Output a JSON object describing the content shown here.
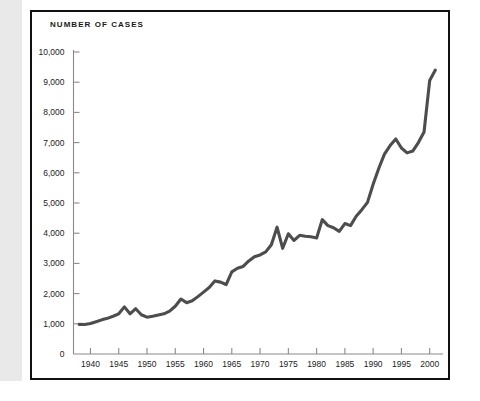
{
  "figure": {
    "title": "NUMBER OF CASES",
    "frame_color": "#111111",
    "edge_strip_color": "#e9e9e9",
    "background_color": "#ffffff"
  },
  "chart_data": {
    "type": "line",
    "title": "NUMBER OF CASES",
    "xlabel": "",
    "ylabel": "",
    "grid": false,
    "legend": "none",
    "line_color": "#4d4d4d",
    "axis_color": "#8a8a8a",
    "xlim": [
      1937,
      2002
    ],
    "ylim": [
      0,
      10000
    ],
    "ytick_values": [
      0,
      1000,
      2000,
      3000,
      4000,
      5000,
      6000,
      7000,
      8000,
      9000,
      10000
    ],
    "ytick_labels": [
      "0",
      "1,000",
      "2,000",
      "3,000",
      "4,000",
      "5,000",
      "6,000",
      "7,000",
      "8,000",
      "9,000",
      "10,000"
    ],
    "xtick_values": [
      1940,
      1945,
      1950,
      1955,
      1960,
      1965,
      1970,
      1975,
      1980,
      1985,
      1990,
      1995,
      2000
    ],
    "xtick_labels": [
      "1940",
      "1945",
      "1950",
      "1955",
      "1960",
      "1965",
      "1970",
      "1975",
      "1980",
      "1985",
      "1990",
      "1995",
      "2000"
    ],
    "series": [
      {
        "name": "Number of cases",
        "x": [
          1938,
          1939,
          1940,
          1941,
          1942,
          1943,
          1944,
          1945,
          1946,
          1947,
          1948,
          1949,
          1950,
          1951,
          1952,
          1953,
          1954,
          1955,
          1956,
          1957,
          1958,
          1959,
          1960,
          1961,
          1962,
          1963,
          1964,
          1965,
          1966,
          1967,
          1968,
          1969,
          1970,
          1971,
          1972,
          1973,
          1974,
          1975,
          1976,
          1977,
          1978,
          1979,
          1980,
          1981,
          1982,
          1983,
          1984,
          1985,
          1986,
          1987,
          1988,
          1989,
          1990,
          1991,
          1992,
          1993,
          1994,
          1995,
          1996,
          1997,
          1998,
          1999,
          2000,
          2001
        ],
        "values": [
          980,
          975,
          1010,
          1070,
          1130,
          1180,
          1250,
          1330,
          1560,
          1330,
          1500,
          1300,
          1220,
          1250,
          1290,
          1330,
          1420,
          1580,
          1820,
          1700,
          1760,
          1900,
          2050,
          2200,
          2420,
          2380,
          2300,
          2720,
          2840,
          2900,
          3080,
          3220,
          3280,
          3380,
          3620,
          4200,
          3500,
          3980,
          3760,
          3930,
          3900,
          3880,
          3840,
          4450,
          4250,
          4180,
          4060,
          4320,
          4250,
          4560,
          4780,
          5020,
          5620,
          6150,
          6620,
          6900,
          7120,
          6820,
          6660,
          6720,
          7000,
          7350,
          9060,
          9400
        ]
      }
    ],
    "annotations": [
      {
        "label": "postwar peak",
        "x": 1946,
        "y": 1560
      },
      {
        "label": "mid-1970s peak",
        "x": 1973,
        "y": 4200
      },
      {
        "label": "mid-1970s trough",
        "x": 1974,
        "y": 3500
      },
      {
        "label": "mid-1990s peak",
        "x": 1994,
        "y": 7120
      },
      {
        "label": "final value",
        "x": 2001,
        "y": 9400
      }
    ]
  }
}
